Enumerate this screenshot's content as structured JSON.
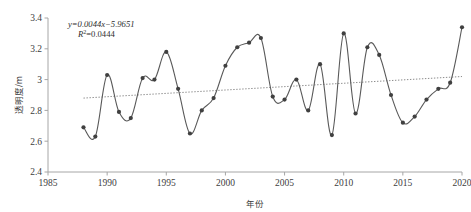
{
  "chart_data": {
    "type": "line",
    "title": "",
    "xlabel": "年份",
    "ylabel": "透明度/m",
    "xlim": [
      1985,
      2020
    ],
    "ylim": [
      2.4,
      3.4
    ],
    "xticks": [
      "1985",
      "1990",
      "1995",
      "2000",
      "2005",
      "2010",
      "2015",
      "2020"
    ],
    "yticks": [
      "2.4",
      "2.6",
      "2.8",
      "3",
      "3.2",
      "3.4"
    ],
    "grid": false,
    "legend": "none",
    "marker": "round-dot",
    "series": [
      {
        "name": "透明度",
        "x": [
          1988,
          1989,
          1990,
          1991,
          1992,
          1993,
          1994,
          1995,
          1996,
          1997,
          1998,
          1999,
          2000,
          2001,
          2002,
          2003,
          2004,
          2005,
          2006,
          2007,
          2008,
          2009,
          2010,
          2011,
          2012,
          2013,
          2014,
          2015,
          2016,
          2017,
          2018,
          2019,
          2020
        ],
        "values": [
          2.69,
          2.63,
          3.03,
          2.79,
          2.75,
          3.01,
          3.0,
          3.18,
          2.94,
          2.65,
          2.8,
          2.88,
          3.09,
          3.21,
          3.24,
          3.27,
          2.89,
          2.87,
          3.0,
          2.8,
          3.1,
          2.64,
          3.3,
          2.78,
          3.21,
          3.16,
          2.9,
          2.72,
          2.76,
          2.87,
          2.94,
          2.98,
          3.34
        ]
      }
    ],
    "trendline": {
      "name": "线性趋势线",
      "equation": "y=0.0044x−5.9651",
      "r_squared": "R2=0.0444",
      "r_squared_base": "R",
      "r_squared_sup": "2",
      "r_squared_value": "=0.0444",
      "slope": 0.0044,
      "intercept": -5.9651,
      "x_start": 1988,
      "x_end": 2020,
      "y_start": 2.88,
      "y_end": 3.02,
      "style": "dotted"
    },
    "annotations": [
      {
        "name": "regression-equation",
        "text": "y=0.0044x−5.9651"
      },
      {
        "name": "r-squared",
        "text": "R2=0.0444"
      }
    ],
    "colors": {
      "series_line": "#595959",
      "marker": "#404040",
      "trendline": "#8c8c8c",
      "axis": "#a6a6a6",
      "text": "#3a3a3a",
      "background": "#ffffff"
    }
  }
}
